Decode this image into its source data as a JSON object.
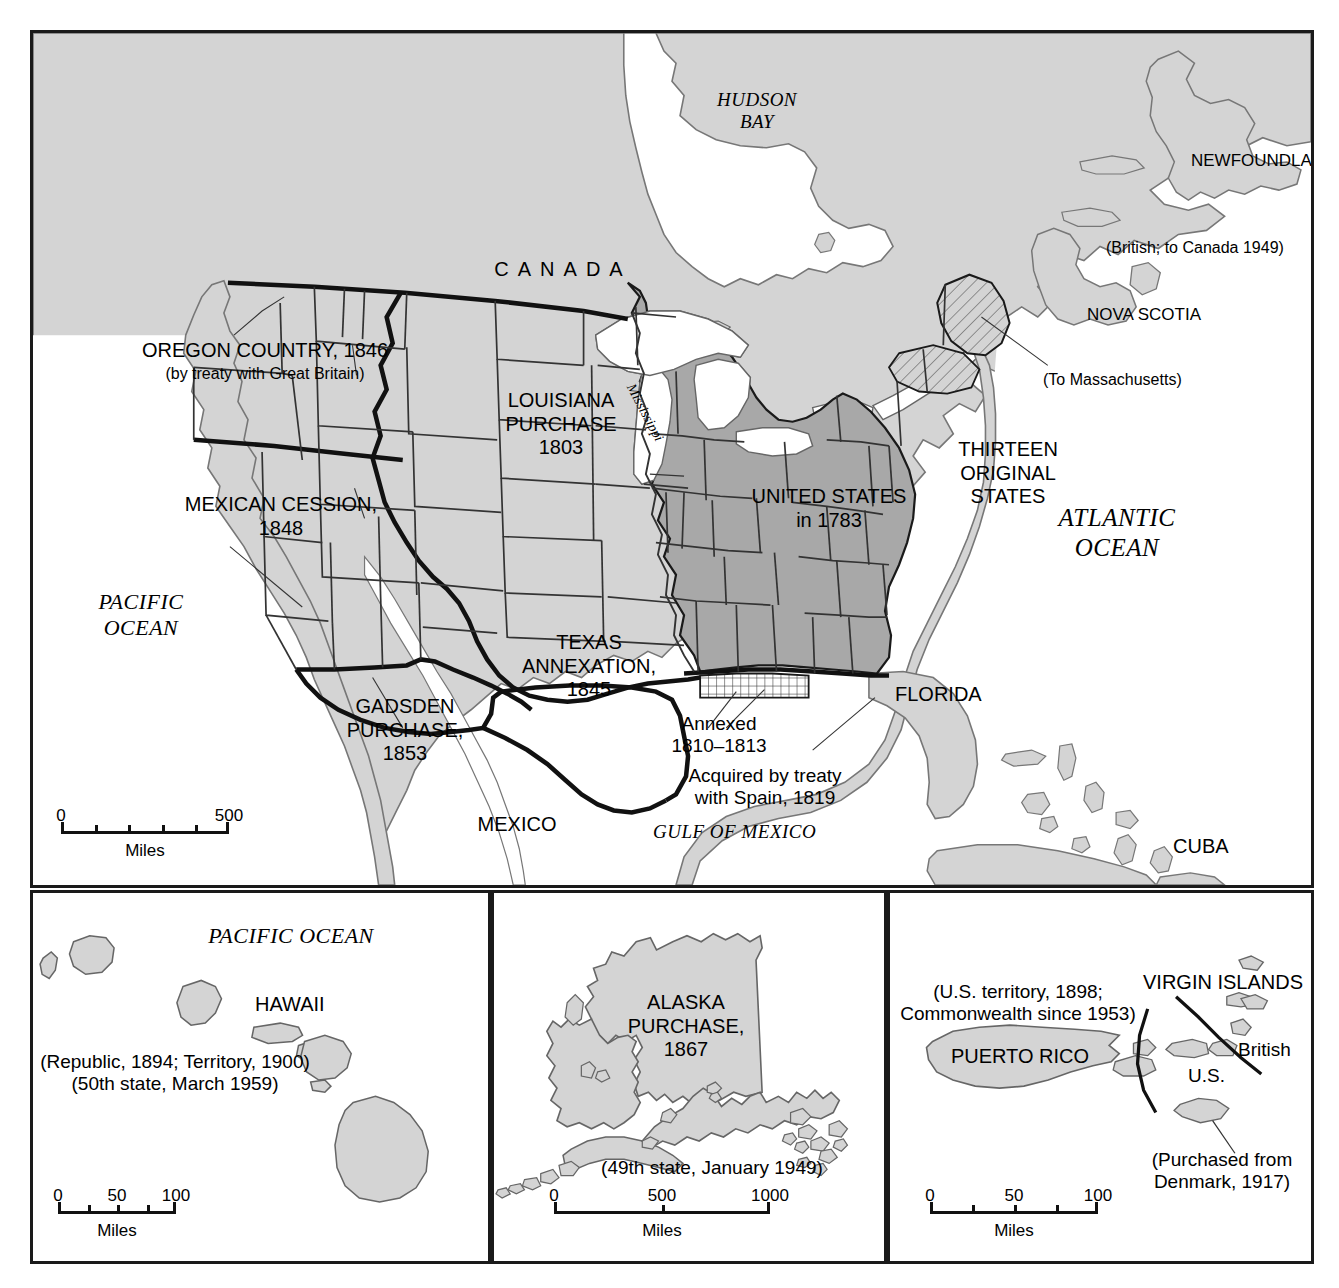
{
  "map": {
    "title": "Territorial Expansion of the United States",
    "colors": {
      "land_light": "#d4d4d4",
      "land_dark": "#a8a8a8",
      "water": "#ffffff",
      "ink": "#111111",
      "frame": "#1a1a1a"
    }
  },
  "main": {
    "labels": {
      "hudson_bay": "HUDSON\nBAY",
      "canada": "CANADA",
      "newfoundland": "NEWFOUNDLAND",
      "newfoundland_note": "(British; to Canada 1949)",
      "nova_scotia": "NOVA SCOTIA",
      "to_massachusetts": "(To Massachusetts)",
      "oregon_country": "OREGON COUNTRY, 1846",
      "oregon_note": "(by treaty with Great Britain)",
      "louisiana_purchase": "LOUISIANA\nPURCHASE\n1803",
      "mexican_cession": "MEXICAN CESSION,\n1848",
      "gadsden_purchase": "GADSDEN\nPURCHASE,\n1853",
      "texas_annexation": "TEXAS\nANNEXATION,\n1845",
      "united_states_1783": "UNITED STATES\nin 1783",
      "thirteen_original_states": "THIRTEEN\nORIGINAL\nSTATES",
      "annexed": "Annexed\n1810–1813",
      "acquired_spain": "Acquired by treaty\nwith Spain, 1819",
      "florida": "FLORIDA",
      "mexico": "MEXICO",
      "cuba": "CUBA",
      "mississippi": "Mississippi",
      "pacific_ocean": "PACIFIC\nOCEAN",
      "atlantic_ocean": "ATLANTIC\nOCEAN",
      "gulf_of_mexico": "GULF OF MEXICO"
    },
    "scale": {
      "units": "Miles",
      "ticks": [
        "0",
        "500"
      ],
      "segments": 5,
      "min": 0,
      "max": 500
    }
  },
  "hawaii": {
    "ocean_label": "PACIFIC OCEAN",
    "name": "HAWAII",
    "note_1": "(Republic, 1894; Territory, 1900)",
    "note_2": "(50th state, March 1959)",
    "scale": {
      "units": "Miles",
      "ticks": [
        "0",
        "50",
        "100"
      ],
      "segments": 4,
      "min": 0,
      "max": 100
    }
  },
  "alaska": {
    "name": "ALASKA\nPURCHASE,\n1867",
    "note": "(49th state, January 1949)",
    "scale": {
      "units": "Miles",
      "ticks": [
        "0",
        "500",
        "1000"
      ],
      "segments": 2,
      "min": 0,
      "max": 1000
    }
  },
  "puerto_rico": {
    "note": "(U.S. territory, 1898;\nCommonwealth since 1953)",
    "name": "PUERTO RICO",
    "virgin_islands": "VIRGIN ISLANDS",
    "british_label": "British",
    "us_label": "U.S.",
    "denmark_note": "(Purchased from\nDenmark, 1917)",
    "scale": {
      "units": "Miles",
      "ticks": [
        "0",
        "50",
        "100"
      ],
      "segments": 4,
      "min": 0,
      "max": 100
    }
  }
}
